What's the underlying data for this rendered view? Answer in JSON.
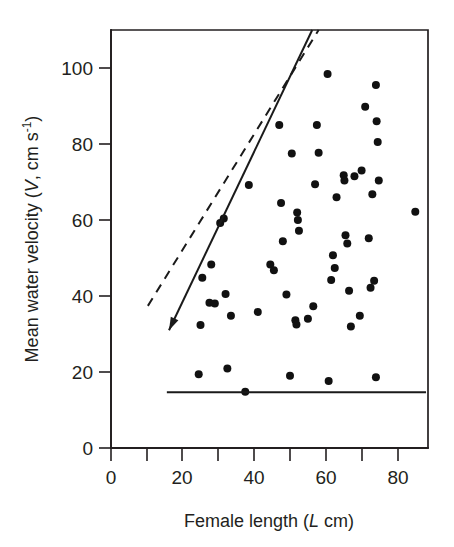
{
  "figure": {
    "background_color": "#ffffff",
    "ink_color": "#231f20"
  },
  "chart_data": {
    "type": "scatter",
    "title": "",
    "xlabel": "Female length (L cm)",
    "ylabel": "Mean water velocity (V, cm s-1)",
    "xlabel_parts": {
      "text": "Female length (",
      "italic": "L",
      "tail": " cm)"
    },
    "ylabel_parts": {
      "head": "Mean water velocity (",
      "italic": "V",
      "mid": ", cm s",
      "superscript": "-1",
      "tail": ")"
    },
    "xlim": [
      0,
      88
    ],
    "ylim": [
      0,
      112
    ],
    "xticks": [
      0,
      10,
      20,
      30,
      40,
      50,
      60,
      70,
      80
    ],
    "xtick_labels": [
      "0",
      "",
      "20",
      "",
      "40",
      "",
      "60",
      "",
      "80"
    ],
    "yticks": [
      0,
      20,
      40,
      60,
      80,
      100
    ],
    "ytick_labels": [
      "0",
      "20",
      "40",
      "60",
      "80",
      "100"
    ],
    "grid": false,
    "legend": "none",
    "marker": "filled-circle",
    "points": [
      [
        24.5,
        19.4
      ],
      [
        25.0,
        32.4
      ],
      [
        25.5,
        44.8
      ],
      [
        27.5,
        38.2
      ],
      [
        28.0,
        48.3
      ],
      [
        29.0,
        38.0
      ],
      [
        30.5,
        59.2
      ],
      [
        31.5,
        60.4
      ],
      [
        32.0,
        40.5
      ],
      [
        32.5,
        20.9
      ],
      [
        33.5,
        34.8
      ],
      [
        37.5,
        14.8
      ],
      [
        38.5,
        69.2
      ],
      [
        41.0,
        35.8
      ],
      [
        44.5,
        48.3
      ],
      [
        45.5,
        46.8
      ],
      [
        47.0,
        85.0
      ],
      [
        47.5,
        64.5
      ],
      [
        48.0,
        54.4
      ],
      [
        49.0,
        40.4
      ],
      [
        50.0,
        19.0
      ],
      [
        50.5,
        77.5
      ],
      [
        51.5,
        33.6
      ],
      [
        51.8,
        32.5
      ],
      [
        52.0,
        62.0
      ],
      [
        52.2,
        60.0
      ],
      [
        52.5,
        57.2
      ],
      [
        55.0,
        34.0
      ],
      [
        56.5,
        37.3
      ],
      [
        57.0,
        69.4
      ],
      [
        57.5,
        85.0
      ],
      [
        58.0,
        77.7
      ],
      [
        60.5,
        98.4
      ],
      [
        60.8,
        17.6
      ],
      [
        61.5,
        44.2
      ],
      [
        62.0,
        50.7
      ],
      [
        62.5,
        47.4
      ],
      [
        63.0,
        66.0
      ],
      [
        65.0,
        71.8
      ],
      [
        65.2,
        70.4
      ],
      [
        65.5,
        56.0
      ],
      [
        66.0,
        53.8
      ],
      [
        66.5,
        41.4
      ],
      [
        67.0,
        32.0
      ],
      [
        68.0,
        71.5
      ],
      [
        69.5,
        34.8
      ],
      [
        70.0,
        73.0
      ],
      [
        71.0,
        89.8
      ],
      [
        72.0,
        55.2
      ],
      [
        72.5,
        42.2
      ],
      [
        73.0,
        66.8
      ],
      [
        73.5,
        44.0
      ],
      [
        74.0,
        95.5
      ],
      [
        74.2,
        86.0
      ],
      [
        74.5,
        80.5
      ],
      [
        74.8,
        70.4
      ],
      [
        74.0,
        18.6
      ],
      [
        85.0,
        62.2
      ]
    ],
    "lines": [
      {
        "name": "solid-regression-line",
        "style": "solid",
        "arrow": "lower-end",
        "x_start": 16.2,
        "y_start": 31.0,
        "x_end": 56.2,
        "y_end": 110.0
      },
      {
        "name": "dashed-regression-line",
        "style": "dashed",
        "arrow": "none",
        "x_start": 10.3,
        "y_start": 37.4,
        "x_end": 58.0,
        "y_end": 110.0
      },
      {
        "name": "horizontal-threshold-line",
        "style": "solid",
        "orientation": "horizontal",
        "y_value": 14.7,
        "x_start": 15.6,
        "x_end": 88.0
      }
    ]
  }
}
